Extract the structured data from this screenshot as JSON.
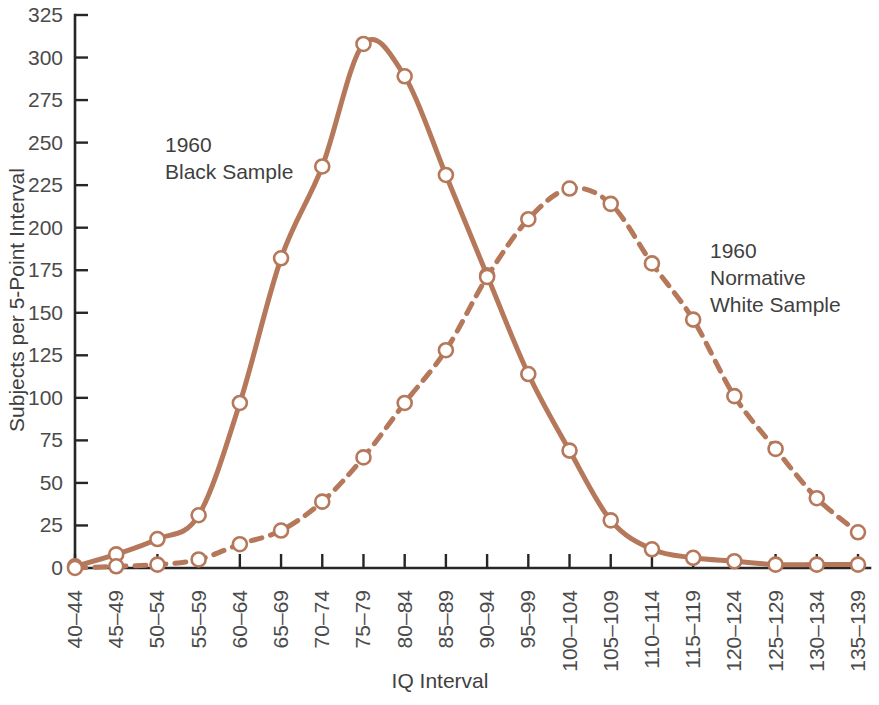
{
  "chart_data": {
    "type": "line",
    "title": "",
    "xlabel": "IQ Interval",
    "ylabel": "Subjects per 5-Point Interval",
    "categories": [
      "40–44",
      "45–49",
      "50–54",
      "55–59",
      "60–64",
      "65–69",
      "70–74",
      "75–79",
      "80–84",
      "85–89",
      "90–94",
      "95–99",
      "100–104",
      "105–109",
      "110–114",
      "115–119",
      "120–124",
      "125–129",
      "130–134",
      "135–139"
    ],
    "ylim": [
      0,
      325
    ],
    "xlim_index": [
      0,
      19
    ],
    "yticks": [
      0,
      25,
      50,
      75,
      100,
      125,
      150,
      175,
      200,
      225,
      250,
      275,
      300,
      325
    ],
    "ytick_labels": [
      "0",
      "25",
      "50",
      "75",
      "100",
      "125",
      "150",
      "175",
      "200",
      "225",
      "250",
      "275",
      "300",
      "325"
    ],
    "grid": false,
    "legend_position": "inline-annotations",
    "series": [
      {
        "name": "1960 Black Sample",
        "style": "solid",
        "color": "#b5785a",
        "marker": "open-circle",
        "values": [
          1,
          8,
          17,
          31,
          97,
          182,
          236,
          308,
          289,
          231,
          172,
          114,
          69,
          28,
          11,
          6,
          4,
          2,
          2,
          2
        ]
      },
      {
        "name": "1960 Normative White Sample",
        "style": "dashed",
        "color": "#b5785a",
        "marker": "open-circle",
        "values": [
          0,
          1,
          2,
          5,
          14,
          22,
          39,
          65,
          97,
          128,
          171,
          205,
          223,
          214,
          179,
          146,
          101,
          70,
          41,
          21
        ]
      }
    ],
    "annotations": [
      {
        "id": "black-sample-annotation",
        "lines": [
          "1960",
          "Black Sample"
        ],
        "x": 165,
        "y": 152
      },
      {
        "id": "white-sample-annotation",
        "lines": [
          "1960",
          "Normative",
          "White Sample"
        ],
        "x": 710,
        "y": 258
      }
    ]
  },
  "axes": {
    "y_axis_title": "Subjects per 5-Point Interval",
    "x_axis_title": "IQ Interval"
  },
  "colors": {
    "series": "#b5785a",
    "axis": "#262626",
    "text": "#3f3f3f",
    "background": "#ffffff"
  }
}
